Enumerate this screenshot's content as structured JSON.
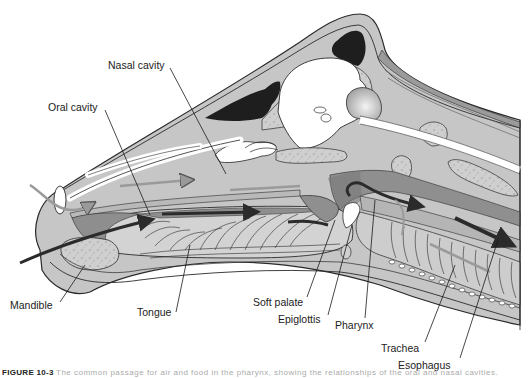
{
  "figure": {
    "type": "anatomical sagittal section",
    "caption_number": "FIGURE 10-3",
    "caption_text": "The common passage for air and food in the pharynx, showing the relationships of the oral and nasal cavities."
  },
  "labels": {
    "nasal_cavity": "Nasal cavity",
    "oral_cavity": "Oral cavity",
    "mandible": "Mandible",
    "tongue": "Tongue",
    "soft_palate": "Soft palate",
    "epiglottis": "Epiglottis",
    "pharynx": "Pharynx",
    "trachea": "Trachea",
    "esophagus": "Esophagus"
  },
  "colors": {
    "outline": "#2a2a2a",
    "tissue_light": "#c8c8c8",
    "tissue_mid": "#a9a9a9",
    "tissue_dark": "#8a8a8a",
    "sinus_black": "#1e1e1e",
    "bone_speckle": "#d6d6d6",
    "airway_white": "#ffffff",
    "arrow_dark": "#2b2b2b",
    "arrow_light": "#9a9a9a"
  }
}
